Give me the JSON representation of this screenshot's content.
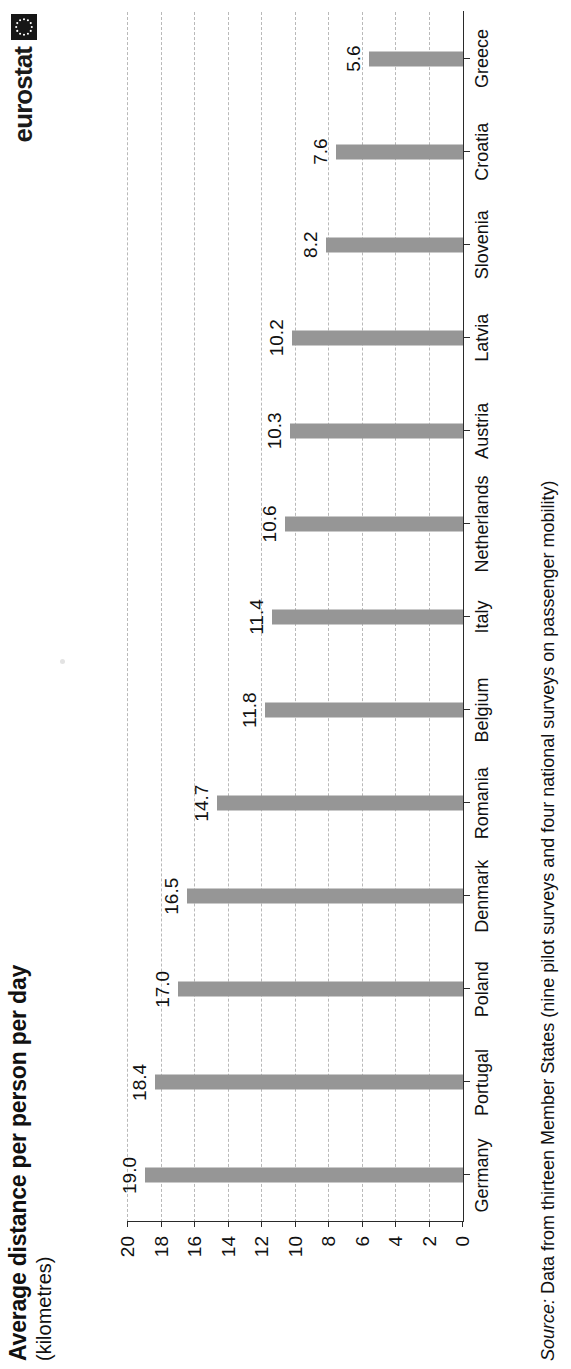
{
  "header": {
    "title": "Average distance per person per day",
    "subtitle": "(kilometres)",
    "logo_text": "eurostat",
    "logo_emblem": "eu-stars-emblem"
  },
  "source": {
    "label": "Source:",
    "text": " Data from thirteen Member States (nine pilot surveys and four national surveys  on passenger mobility)"
  },
  "chart_data": {
    "type": "bar",
    "title": "Average distance per person per day",
    "subtitle": "(kilometres)",
    "xlabel": "",
    "ylabel": "(kilometres)",
    "ylim": [
      0,
      20
    ],
    "yticks": [
      0,
      2,
      4,
      6,
      8,
      10,
      12,
      14,
      16,
      18,
      20
    ],
    "ytick_labels": [
      "0",
      "2",
      "4",
      "6",
      "8",
      "10",
      "12",
      "14",
      "16",
      "18",
      "20"
    ],
    "grid": true,
    "grid_style": "dashed-horizontal",
    "legend": false,
    "orientation": "vertical-bars",
    "bar_color": "#969696",
    "categories": [
      "Germany",
      "Portugal",
      "Poland",
      "Denmark",
      "Romania",
      "Belgium",
      "Italy",
      "Netherlands",
      "Austria",
      "Latvia",
      "Slovenia",
      "Croatia",
      "Greece"
    ],
    "values": [
      19.0,
      18.4,
      17.0,
      16.5,
      14.7,
      11.8,
      11.4,
      10.6,
      10.3,
      10.2,
      8.2,
      7.6,
      5.6
    ],
    "value_labels": [
      "19.0",
      "18.4",
      "17.0",
      "16.5",
      "14.7",
      "11.8",
      "11.4",
      "10.6",
      "10.3",
      "10.2",
      "8.2",
      "7.6",
      "5.6"
    ]
  }
}
